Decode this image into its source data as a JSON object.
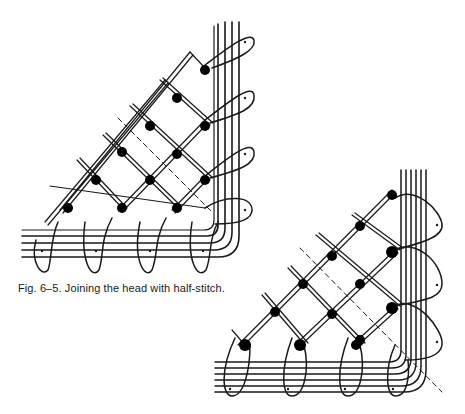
{
  "figure": {
    "caption": "Fig. 6–5. Joining the head with half-stitch.",
    "diagrams": [
      {
        "name": "upper-left-corner-diagram",
        "description": "Half-stitch ground meeting a corner headside (pins marked with dots)"
      },
      {
        "name": "lower-right-corner-diagram",
        "description": "Half-stitch ground meeting corner headside, variation"
      }
    ],
    "colors": {
      "ink": "#1a1a1a",
      "paper": "#ffffff"
    }
  }
}
